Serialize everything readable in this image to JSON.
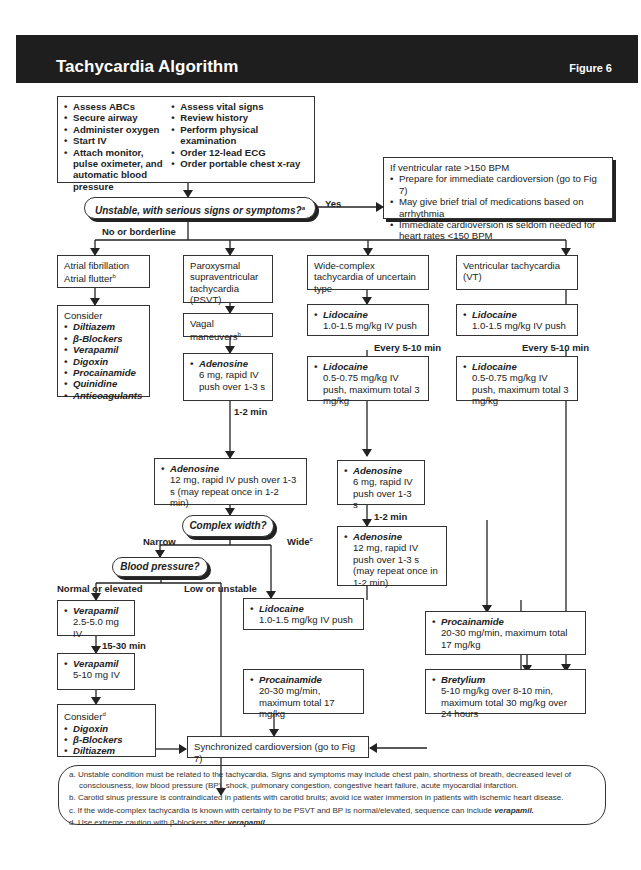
{
  "header": {
    "title": "Tachycardia Algorithm",
    "figure": "Figure 6"
  },
  "assess": {
    "col1": [
      "Assess ABCs",
      "Secure airway",
      "Administer oxygen",
      "Start IV",
      "Attach monitor, pulse oximeter, and automatic blood pressure"
    ],
    "col2": [
      "Assess vital signs",
      "Review history",
      "Perform physical examination",
      "Order 12-lead ECG",
      "Order portable chest x-ray"
    ]
  },
  "unstable": {
    "question": "Unstable, with serious signs or symptoms?",
    "sup": "a",
    "yes": "Yes",
    "no": "No or borderline",
    "yes_box": {
      "intro": "If ventricular rate >150 BPM",
      "items": [
        "Prepare for immediate cardioversion (go to Fig 7)",
        "May give brief trial of medications based on arrhythmia",
        "Immediate cardioversion is seldom needed for heart rates <150 BPM"
      ]
    }
  },
  "afib": {
    "title1": "Atrial fibrillation",
    "title2": "Atrial flutter",
    "sup": "b",
    "consider": "Consider",
    "drugs": [
      "Diltiazem",
      "β-Blockers",
      "Verapamil",
      "Digoxin",
      "Procainamide",
      "Quinidine",
      "Anticoagulants"
    ]
  },
  "psvt": {
    "title": "Paroxysmal supraventricular tachycardia (PSVT)",
    "vagal": "Vagal maneuvers",
    "vagal_sup": "b",
    "aden1": {
      "drug": "Adenosine",
      "dose": "6 mg, rapid IV push over 1-3 s"
    },
    "interval": "1-2 min",
    "aden2": {
      "drug": "Adenosine",
      "dose": "12 mg, rapid IV push over 1-3 s (may repeat once in 1-2 min)"
    },
    "width_q": "Complex width?",
    "narrow": "Narrow",
    "wide": "Wide",
    "wide_sup": "c",
    "bp_q": "Blood pressure?",
    "normal": "Normal or elevated",
    "low": "Low or unstable",
    "vera1": {
      "drug": "Verapamil",
      "dose": "2.5-5.0 mg IV"
    },
    "vera_interval": "15-30 min",
    "vera2": {
      "drug": "Verapamil",
      "dose": "5-10 mg IV"
    },
    "consider": "Consider",
    "consider_sup": "d",
    "consider_drugs": [
      "Digoxin",
      "β-Blockers",
      "Diltiazem"
    ],
    "lido": {
      "drug": "Lidocaine",
      "dose": "1.0-1.5 mg/kg IV push"
    },
    "proc": {
      "drug": "Procainamide",
      "dose": "20-30 mg/min, maximum total 17 mg/kg"
    }
  },
  "wide": {
    "title": "Wide-complex tachycardia of uncertain type",
    "lido1": {
      "drug": "Lidocaine",
      "dose": "1.0-1.5 mg/kg IV push"
    },
    "interval": "Every 5-10 min",
    "lido2": {
      "drug": "Lidocaine",
      "dose": "0.5-0.75 mg/kg IV push, maximum total 3 mg/kg"
    },
    "aden1": {
      "drug": "Adenosine",
      "dose": "6 mg, rapid IV push over 1-3 s"
    },
    "interval2": "1-2 min",
    "aden2": {
      "drug": "Adenosine",
      "dose": "12 mg, rapid IV push over 1-3 s (may repeat once in 1-2 min)"
    }
  },
  "vt": {
    "title": "Ventricular tachycardia (VT)",
    "lido1": {
      "drug": "Lidocaine",
      "dose": "1.0-1.5 mg/kg IV push"
    },
    "interval": "Every 5-10 min",
    "lido2": {
      "drug": "Lidocaine",
      "dose": "0.5-0.75 mg/kg IV push, maximum total 3 mg/kg"
    }
  },
  "proc_right": {
    "drug": "Procainamide",
    "dose": "20-30 mg/min, maximum total 17 mg/kg"
  },
  "bretylium": {
    "drug": "Bretylium",
    "dose": "5-10 mg/kg over 8-10 min, maximum total 30 mg/kg over 24 hours"
  },
  "sync": "Synchronized cardioversion (go to Fig 7)",
  "notes": {
    "a": "a.  Unstable condition must be related to the tachycardia. Signs and symptoms may include chest pain, shortness of breath, decreased level of consciousness, low blood pressure (BP), shock, pulmonary congestion, congestive heart failure, acute myocardial infarction.",
    "b": "b.  Carotid sinus pressure is contraindicated in patients with carotid bruits; avoid ice water immersion in patients with ischemic heart disease.",
    "c_pre": "c.  If the wide-complex tachycardia is known with certainty to be PSVT and BP is normal/elevated, sequence can include ",
    "c_drug": "verapamil.",
    "d_pre": "d.  Use extreme caution with β-blockers after ",
    "d_drug": "verapamil."
  }
}
